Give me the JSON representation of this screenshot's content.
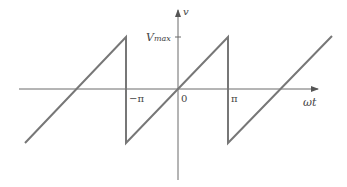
{
  "diagram": {
    "type": "sawtooth waveform",
    "y_axis_label": "v",
    "x_axis_label": "ωt",
    "vmax_label_main": "V",
    "vmax_label_sub": "max",
    "tick_labels": {
      "neg_pi": "−π",
      "zero": "0",
      "pi": "π"
    },
    "colors": {
      "wave": "#777777",
      "axis": "#6a6a6a",
      "text": "#444444"
    }
  }
}
